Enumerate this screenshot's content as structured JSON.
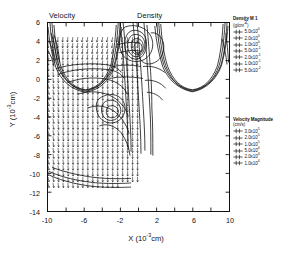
{
  "titles": {
    "velocity_panel": "Velocity",
    "density_panel": "Density"
  },
  "axes": {
    "x": {
      "label_text": "X",
      "label_units_base": "(10",
      "label_units_exp": "-3",
      "label_units_tail": "cm)",
      "min": -10,
      "max": 10,
      "major_ticks": [
        -10,
        -6,
        -2,
        2,
        6,
        10
      ],
      "tick_labels": [
        "-10",
        "-6",
        "-2",
        "2",
        "6",
        "10"
      ]
    },
    "y": {
      "label_text": "Y",
      "label_units_base": "(10",
      "label_units_exp": "-3",
      "label_units_tail": "cm)",
      "min": -14,
      "max": 6,
      "major_ticks": [
        6,
        4,
        2,
        0,
        -2,
        -4,
        -6,
        -8,
        -10,
        -12,
        -14
      ],
      "tick_labels": [
        "6",
        "4",
        "2",
        "0",
        "-2",
        "-4",
        "-6",
        "-8",
        "-10",
        "-12",
        "-14"
      ]
    }
  },
  "legends": {
    "density": {
      "title": "Density M 1",
      "units": "(g/cm",
      "units_exp": "3",
      "units_tail": ")",
      "entries": [
        {
          "mantissa": "5.0x10",
          "exponent": "0"
        },
        {
          "mantissa": "2.0x10",
          "exponent": "0"
        },
        {
          "mantissa": "1.0x10",
          "exponent": "0"
        },
        {
          "mantissa": "5.0x10",
          "exponent": "-1"
        },
        {
          "mantissa": "2.0x10",
          "exponent": "-1"
        },
        {
          "mantissa": "1.0x10",
          "exponent": "-1"
        },
        {
          "mantissa": "5.0x10",
          "exponent": "-2"
        }
      ]
    },
    "velocity": {
      "title": "Velocity Magnitude",
      "units": "(cm/s)",
      "units_exp": "",
      "units_tail": "",
      "entries": [
        {
          "mantissa": "3.0x10",
          "exponent": "5"
        },
        {
          "mantissa": "2.0x10",
          "exponent": "5"
        },
        {
          "mantissa": "1.0x10",
          "exponent": "5"
        },
        {
          "mantissa": "5.0x10",
          "exponent": "4"
        },
        {
          "mantissa": "2.0x10",
          "exponent": "4"
        },
        {
          "mantissa": "1.0x10",
          "exponent": "4"
        }
      ]
    }
  },
  "chart_data": {
    "type": "scatter",
    "xlabel": "X (10^-3 cm)",
    "ylabel": "Y (10^-3 cm)",
    "xlim": [
      -10,
      10
    ],
    "ylim": [
      -14,
      6
    ],
    "grid": false,
    "legend_position": "right",
    "series": [
      {
        "name": "Velocity Magnitude",
        "kind": "vector-field",
        "units": "cm/s",
        "levels": [
          300000,
          200000,
          100000,
          50000,
          20000,
          10000
        ],
        "level_labels": [
          "3.0x10^5",
          "2.0x10^5",
          "1.0x10^5",
          "5.0x10^4",
          "2.0x10^4",
          "1.0x10^4"
        ],
        "arrow_grid": {
          "x_range": [
            -10.0,
            0.2
          ],
          "y_range": [
            -11.0,
            4.5
          ],
          "x_step": 0.55,
          "y_step": 0.62,
          "dominant_direction_deg": 270,
          "note": "dense regular lattice of short arrows pointing downward, fanning outward near the left and upper edges"
        }
      },
      {
        "name": "Density M 1",
        "kind": "contour",
        "units": "g/cm^3",
        "levels": [
          5.0,
          2.0,
          1.0,
          0.5,
          0.2,
          0.1,
          0.05
        ],
        "level_labels": [
          "5.0x10^0",
          "2.0x10^0",
          "1.0x10^0",
          "5.0x10^-1",
          "2.0x10^-1",
          "1.0x10^-1",
          "5.0x10^-2"
        ],
        "features": [
          {
            "shape": "U-trough",
            "x_center": -6.3,
            "y_min": -2.4,
            "note": "left density trough rising to y=6 at x=-10 and x=-2"
          },
          {
            "shape": "U-trough",
            "x_center": 6.3,
            "y_min": -2.4,
            "note": "right density trough rising to y=6 at x=2 and x=10"
          },
          {
            "shape": "nested-loops",
            "x_center": -0.4,
            "y_center": 3.4,
            "note": "dense nested closed contours at top center"
          },
          {
            "shape": "closed-loop",
            "x_center": -1.6,
            "y_center": -3.6,
            "note": "small closed contour island in lower center"
          },
          {
            "shape": "basal-arc",
            "x_center": -5.0,
            "y_center": -11.0,
            "note": "shallow arc bounding the bottom of the vector region"
          }
        ]
      }
    ]
  }
}
